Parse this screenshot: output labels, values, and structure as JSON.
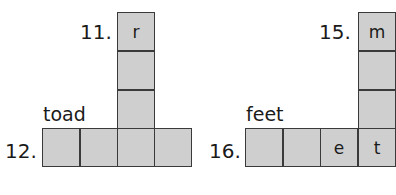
{
  "puzzles": [
    {
      "across_clue": {
        "number": "12.",
        "hint": "toad",
        "cells": [
          "",
          "",
          "",
          ""
        ]
      },
      "down_clue": {
        "number": "11.",
        "cells": [
          "r",
          "",
          ""
        ]
      }
    },
    {
      "across_clue": {
        "number": "16.",
        "hint": "feet",
        "cells": [
          "",
          "",
          "e",
          "t"
        ]
      },
      "down_clue": {
        "number": "15.",
        "cells": [
          "m",
          "",
          ""
        ]
      }
    }
  ],
  "colors": {
    "cell_fill": "#cfcfcf",
    "cell_border": "#3a3a3a",
    "text": "#1a1a1a"
  }
}
